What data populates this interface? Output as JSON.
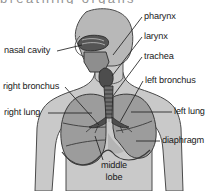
{
  "figure": {
    "clipped_header_text": "breathing organs",
    "style": "grayscale line drawing",
    "colors": {
      "page_background": "#ffffff",
      "body_silhouette": "#c9c9c9",
      "head_shade": "#b5b5b5",
      "lung_fill": "#9a9a9a",
      "lung_fill_light": "#b0b0b0",
      "airway_dark": "#4a4a4a",
      "outline": "#3a3a3a",
      "leader_line": "#2b2b2b",
      "label_text": "#1b1b1b"
    }
  },
  "labels": {
    "pharynx": "pharynx",
    "larynx": "larynx",
    "trachea": "trachea",
    "left_bronchus": "left bronchus",
    "left_lung": "left lung",
    "diaphragm": "diaphragm",
    "nasal_cavity": "nasal cavity",
    "right_bronchus": "right bronchus",
    "right_lung": "right lung",
    "middle_lobe_line1": "middle",
    "middle_lobe_line2": "lobe"
  },
  "parts": [
    {
      "id": "nasal-cavity",
      "label": "nasal cavity",
      "side": "left"
    },
    {
      "id": "right-bronchus",
      "label": "right bronchus",
      "side": "left"
    },
    {
      "id": "right-lung",
      "label": "right lung",
      "side": "left"
    },
    {
      "id": "pharynx",
      "label": "pharynx",
      "side": "right"
    },
    {
      "id": "larynx",
      "label": "larynx",
      "side": "right"
    },
    {
      "id": "trachea",
      "label": "trachea",
      "side": "right"
    },
    {
      "id": "left-bronchus",
      "label": "left bronchus",
      "side": "right"
    },
    {
      "id": "left-lung",
      "label": "left lung",
      "side": "right"
    },
    {
      "id": "diaphragm",
      "label": "diaphragm",
      "side": "right"
    },
    {
      "id": "middle-lobe",
      "label": "middle lobe",
      "side": "bottom"
    }
  ]
}
